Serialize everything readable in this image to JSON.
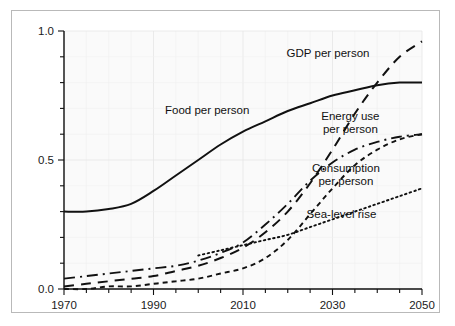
{
  "chart_data": {
    "type": "line",
    "title": "",
    "subtitle": "",
    "xlabel": "",
    "ylabel": "",
    "xlim": [
      1970,
      2050
    ],
    "ylim": [
      0.0,
      1.0
    ],
    "grid": true,
    "legend_position": "inline-annotations",
    "x_ticks": [
      1970,
      1990,
      2010,
      2030,
      2050
    ],
    "x_tick_labels": [
      "1970",
      "1990",
      "2010",
      "2030",
      "2050"
    ],
    "x_minor_tick_interval": 5,
    "y_ticks": [
      0.0,
      0.5,
      1.0
    ],
    "y_tick_labels": [
      "0.0",
      "0.5",
      "1.0"
    ],
    "y_minor_tick_interval": 0.1,
    "x": [
      1970,
      1975,
      1980,
      1985,
      1990,
      1995,
      2000,
      2005,
      2010,
      2015,
      2020,
      2025,
      2030,
      2035,
      2040,
      2045,
      2050
    ],
    "series": [
      {
        "name": "Food per person",
        "line_style": "solid",
        "values": [
          0.3,
          0.3,
          0.31,
          0.33,
          0.38,
          0.44,
          0.5,
          0.56,
          0.61,
          0.65,
          0.69,
          0.72,
          0.75,
          0.77,
          0.79,
          0.8,
          0.8
        ]
      },
      {
        "name": "GDP per person",
        "line_style": "long-dash",
        "values": [
          0.01,
          0.02,
          0.03,
          0.04,
          0.05,
          0.07,
          0.09,
          0.12,
          0.16,
          0.22,
          0.3,
          0.41,
          0.54,
          0.68,
          0.8,
          0.9,
          0.96
        ]
      },
      {
        "name": "Energy use per person",
        "line_style": "dash-dot",
        "values": [
          0.04,
          0.05,
          0.06,
          0.07,
          0.08,
          0.09,
          0.11,
          0.14,
          0.18,
          0.25,
          0.33,
          0.42,
          0.49,
          0.54,
          0.57,
          0.59,
          0.6
        ]
      },
      {
        "name": "Consumption per person",
        "line_style": "short-dash",
        "values": [
          0.0,
          0.0,
          0.01,
          0.01,
          0.02,
          0.03,
          0.04,
          0.06,
          0.08,
          0.12,
          0.19,
          0.29,
          0.39,
          0.48,
          0.54,
          0.58,
          0.6
        ]
      },
      {
        "name": "Sea-level rise",
        "line_style": "dotted",
        "start_year": 2000,
        "values": [
          null,
          null,
          null,
          null,
          null,
          null,
          0.13,
          0.15,
          0.17,
          0.19,
          0.21,
          0.24,
          0.27,
          0.3,
          0.33,
          0.36,
          0.39
        ]
      }
    ],
    "annotations": [
      {
        "text": "GDP per person",
        "x": 2029,
        "y": 0.9
      },
      {
        "text": "Food per person",
        "x": 2002,
        "y": 0.68
      },
      {
        "text": "Energy use",
        "x": 2034,
        "y": 0.655
      },
      {
        "text": "per person",
        "x": 2034,
        "y": 0.605
      },
      {
        "text": "Consumption",
        "x": 2033,
        "y": 0.455
      },
      {
        "text": "per person",
        "x": 2033,
        "y": 0.405
      },
      {
        "text": "Sea-level rise",
        "x": 2032,
        "y": 0.275
      }
    ]
  },
  "figure": {
    "background_color": "#ffffff",
    "plot_background_color": "#fafafa",
    "border_color": "#b9b9b9",
    "line_color": "#111111",
    "grid_color": "#e6e6e6"
  }
}
